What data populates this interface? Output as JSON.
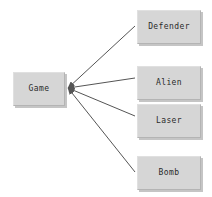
{
  "diagram": {
    "type": "class-relationship-diagram",
    "background_color": "#ffffff",
    "node_fill_color": "#d6d6d6",
    "node_border_color": "#b4b4b4",
    "edge_color": "#555555",
    "root": {
      "id": "game",
      "label": "Game"
    },
    "children": [
      {
        "id": "defender",
        "label": "Defender"
      },
      {
        "id": "alien",
        "label": "Alien"
      },
      {
        "id": "laser",
        "label": "Laser"
      },
      {
        "id": "bomb",
        "label": "Bomb"
      }
    ],
    "edges": [
      {
        "from": "defender",
        "to": "game",
        "arrow_at": "game",
        "arrow": "open-arrow"
      },
      {
        "from": "alien",
        "to": "game",
        "arrow_at": "game",
        "arrow": "open-arrow"
      },
      {
        "from": "laser",
        "to": "game",
        "arrow_at": "game",
        "arrow": "open-arrow"
      },
      {
        "from": "bomb",
        "to": "game",
        "arrow_at": "game",
        "arrow": "open-arrow"
      }
    ]
  }
}
